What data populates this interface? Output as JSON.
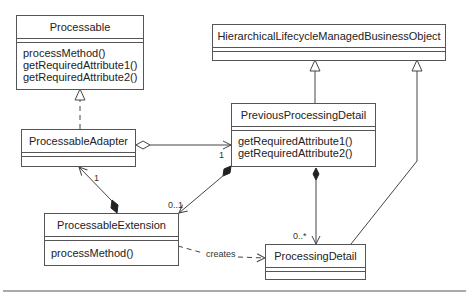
{
  "diagram": {
    "type": "UML class diagram",
    "classes": {
      "processable": {
        "name": "Processable",
        "operations": [
          "processMethod()",
          "getRequiredAttribute1()",
          "getRequiredAttribute2()"
        ]
      },
      "processable_adapter": {
        "name": "ProcessableAdapter",
        "operations": []
      },
      "processable_extension": {
        "name": "ProcessableExtension",
        "operations": [
          "processMethod()"
        ]
      },
      "hlmbo": {
        "name": "HierarchicalLifecycleManagedBusinessObject",
        "operations": []
      },
      "previous_processing_detail": {
        "name": "PreviousProcessingDetail",
        "operations": [
          "getRequiredAttribute1()",
          "getRequiredAttribute2()"
        ]
      },
      "processing_detail": {
        "name": "ProcessingDetail",
        "operations": []
      }
    },
    "relationships": {
      "adapter_to_previous": {
        "kind": "aggregation",
        "multiplicity": "1"
      },
      "extension_to_adapter": {
        "kind": "composition",
        "multiplicity": "1"
      },
      "previous_to_extension": {
        "kind": "composition",
        "multiplicity": "0..1"
      },
      "previous_to_processing": {
        "kind": "composition",
        "multiplicity": "0..*"
      },
      "extension_creates_processing": {
        "kind": "dependency",
        "label": "creates"
      },
      "adapter_realizes_processable": {
        "kind": "realization"
      },
      "previous_extends_hlmbo": {
        "kind": "generalization"
      },
      "processing_extends_hlmbo": {
        "kind": "generalization"
      }
    }
  }
}
